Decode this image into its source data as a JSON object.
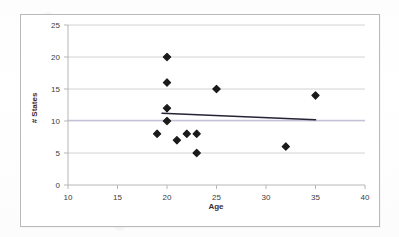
{
  "chart_data": {
    "type": "scatter",
    "title": "",
    "xlabel": "Age",
    "ylabel": "# States",
    "xlim": [
      10,
      40
    ],
    "ylim": [
      0,
      25
    ],
    "xticks": [
      10,
      15,
      20,
      25,
      30,
      35,
      40
    ],
    "yticks": [
      0,
      5,
      10,
      15,
      20,
      25
    ],
    "grid": "horizontal",
    "legend": "none",
    "marker": "diamond",
    "marker_color": "#1a1a1a",
    "points": [
      {
        "x": 19,
        "y": 8
      },
      {
        "x": 20,
        "y": 20
      },
      {
        "x": 20,
        "y": 16
      },
      {
        "x": 20,
        "y": 12
      },
      {
        "x": 20,
        "y": 10
      },
      {
        "x": 21,
        "y": 7
      },
      {
        "x": 22,
        "y": 8
      },
      {
        "x": 23,
        "y": 8
      },
      {
        "x": 23,
        "y": 5
      },
      {
        "x": 25,
        "y": 15
      },
      {
        "x": 32,
        "y": 6
      },
      {
        "x": 35,
        "y": 14
      }
    ],
    "trendline": {
      "name": "linear-trend",
      "color": "#262335",
      "x_start": 19.5,
      "y_start": 11.2,
      "x_end": 35.0,
      "y_end": 10.2
    },
    "baseline": {
      "name": "reference-line",
      "color": "#a9a0c8",
      "y": 10.1
    }
  },
  "axes": {
    "x_tick_labels": [
      "10",
      "15",
      "20",
      "25",
      "30",
      "35",
      "40"
    ],
    "y_tick_labels": [
      "0",
      "5",
      "10",
      "15",
      "20",
      "25"
    ],
    "x_title": "Age",
    "y_title": "# States"
  }
}
